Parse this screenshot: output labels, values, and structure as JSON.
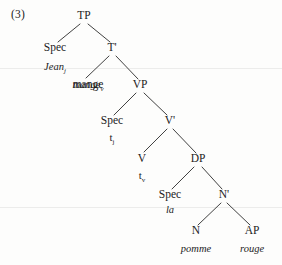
{
  "figure": {
    "example_number": "(3)",
    "language_note": "",
    "ink_color": "#1c1c1c",
    "page_color": "#fdfdfc"
  },
  "tree": {
    "type": "x-bar-syntax-tree",
    "root": "TP",
    "nodes": [
      {
        "id": "TP",
        "label": "TP",
        "x": 84,
        "y": 19
      },
      {
        "id": "Spec_TP",
        "label": "Spec",
        "x": 55,
        "y": 51
      },
      {
        "id": "Tbar",
        "label": "T'",
        "x": 112,
        "y": 51
      },
      {
        "id": "mange",
        "label": "mange",
        "x": 88,
        "y": 88
      },
      {
        "id": "VP",
        "label": "VP",
        "x": 140,
        "y": 88
      },
      {
        "id": "Spec_VP",
        "label": "Spec",
        "x": 112,
        "y": 124
      },
      {
        "id": "Vbar",
        "label": "V'",
        "x": 170,
        "y": 124
      },
      {
        "id": "V",
        "label": "V",
        "x": 142,
        "y": 162
      },
      {
        "id": "DP",
        "label": "DP",
        "x": 198,
        "y": 162
      },
      {
        "id": "Spec_DP",
        "label": "Spec",
        "x": 170,
        "y": 198
      },
      {
        "id": "Nbar",
        "label": "N'",
        "x": 224,
        "y": 198
      },
      {
        "id": "N",
        "label": "N",
        "x": 196,
        "y": 234
      },
      {
        "id": "AP",
        "label": "AP",
        "x": 252,
        "y": 234
      }
    ],
    "terminals": [
      {
        "id": "t_jean",
        "parent": "Spec_TP",
        "text": "Jean",
        "subscript": "j",
        "italic": true,
        "x": 55,
        "y": 70
      },
      {
        "id": "t_mange",
        "parent": "Tbar",
        "text": "mange",
        "subscript": "v",
        "italic": true,
        "x": 88,
        "y": 88
      },
      {
        "id": "t_trace_j",
        "parent": "Spec_VP",
        "text": "t",
        "subscript": "j",
        "italic": false,
        "x": 112,
        "y": 141
      },
      {
        "id": "t_trace_v",
        "parent": "V",
        "text": "t",
        "subscript": "v",
        "italic": false,
        "x": 142,
        "y": 179
      },
      {
        "id": "t_la",
        "parent": "Spec_DP",
        "text": "la",
        "subscript": "",
        "italic": true,
        "x": 170,
        "y": 213
      },
      {
        "id": "t_pomme",
        "parent": "N",
        "text": "pomme",
        "subscript": "",
        "italic": true,
        "x": 196,
        "y": 252
      },
      {
        "id": "t_rouge",
        "parent": "AP",
        "text": "rouge",
        "subscript": "",
        "italic": true,
        "x": 252,
        "y": 252
      }
    ],
    "edges": [
      {
        "from": "TP",
        "to": "Spec_TP",
        "x1": 80,
        "y1": 24,
        "x2": 58,
        "y2": 42
      },
      {
        "from": "TP",
        "to": "Tbar",
        "x1": 88,
        "y1": 24,
        "x2": 110,
        "y2": 42
      },
      {
        "from": "Tbar",
        "to": "mange",
        "x1": 109,
        "y1": 56,
        "x2": 86,
        "y2": 78
      },
      {
        "from": "Tbar",
        "to": "VP",
        "x1": 116,
        "y1": 56,
        "x2": 138,
        "y2": 79
      },
      {
        "from": "VP",
        "to": "Spec_VP",
        "x1": 136,
        "y1": 93,
        "x2": 114,
        "y2": 115
      },
      {
        "from": "VP",
        "to": "Vbar",
        "x1": 144,
        "y1": 93,
        "x2": 167,
        "y2": 115
      },
      {
        "from": "Vbar",
        "to": "V",
        "x1": 167,
        "y1": 129,
        "x2": 144,
        "y2": 152
      },
      {
        "from": "Vbar",
        "to": "DP",
        "x1": 173,
        "y1": 129,
        "x2": 196,
        "y2": 153
      },
      {
        "from": "DP",
        "to": "Spec_DP",
        "x1": 194,
        "y1": 167,
        "x2": 172,
        "y2": 189
      },
      {
        "from": "DP",
        "to": "Nbar",
        "x1": 202,
        "y1": 167,
        "x2": 222,
        "y2": 189
      },
      {
        "from": "Nbar",
        "to": "N",
        "x1": 221,
        "y1": 203,
        "x2": 198,
        "y2": 225
      },
      {
        "from": "Nbar",
        "to": "AP",
        "x1": 227,
        "y1": 203,
        "x2": 250,
        "y2": 225
      }
    ]
  }
}
